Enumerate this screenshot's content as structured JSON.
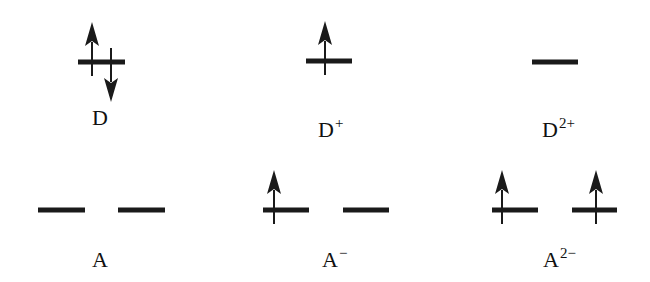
{
  "diagram": {
    "states": [
      {
        "id": "D",
        "label": "D",
        "charge": "",
        "levels": [
          {
            "x1": 78,
            "x2": 125,
            "y": 62,
            "electrons": [
              {
                "dir": "up",
                "x": 92
              },
              {
                "dir": "down",
                "x": 111
              }
            ]
          }
        ],
        "label_x": 92,
        "label_y": 104
      },
      {
        "id": "D+",
        "label": "D",
        "charge": "+",
        "levels": [
          {
            "x1": 306,
            "x2": 352,
            "y": 61,
            "electrons": [
              {
                "dir": "up",
                "x": 325
              }
            ]
          }
        ],
        "label_x": 318,
        "label_y": 116
      },
      {
        "id": "D2+",
        "label": "D",
        "charge": "2+",
        "levels": [
          {
            "x1": 532,
            "x2": 578,
            "y": 62,
            "electrons": []
          }
        ],
        "label_x": 542,
        "label_y": 116
      },
      {
        "id": "A",
        "label": "A",
        "charge": "",
        "levels": [
          {
            "x1": 38,
            "x2": 85,
            "y": 210,
            "electrons": []
          },
          {
            "x1": 118,
            "x2": 165,
            "y": 210,
            "electrons": []
          }
        ],
        "label_x": 92,
        "label_y": 246
      },
      {
        "id": "A-",
        "label": "A",
        "charge": "−",
        "levels": [
          {
            "x1": 263,
            "x2": 309,
            "y": 210,
            "electrons": [
              {
                "dir": "up",
                "x": 274
              }
            ]
          },
          {
            "x1": 343,
            "x2": 389,
            "y": 210,
            "electrons": []
          }
        ],
        "label_x": 322,
        "label_y": 246
      },
      {
        "id": "A2-",
        "label": "A",
        "charge": "2−",
        "levels": [
          {
            "x1": 492,
            "x2": 538,
            "y": 210,
            "electrons": [
              {
                "dir": "up",
                "x": 502
              }
            ]
          },
          {
            "x1": 572,
            "x2": 617,
            "y": 210,
            "electrons": [
              {
                "dir": "up",
                "x": 596
              }
            ]
          }
        ],
        "label_x": 543,
        "label_y": 246
      }
    ],
    "colors": {
      "line": "#1a1a1a",
      "text": "#111111",
      "background": "#ffffff"
    }
  }
}
